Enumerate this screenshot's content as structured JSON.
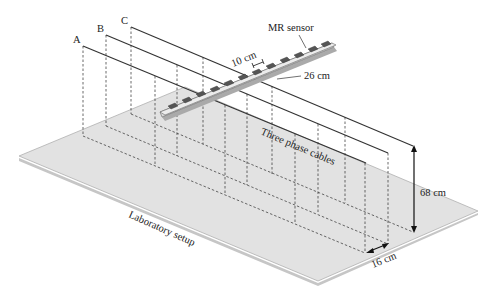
{
  "figure": {
    "title": "Laboratory setup",
    "labels": {
      "mr_sensor": "MR sensor",
      "sensor_spacing": "10 cm",
      "sensor_height_offset": "26 cm",
      "cables": "Three phase cables",
      "cable_height": "68 cm",
      "cable_spacing": "16 cm",
      "setup": "Laboratory setup"
    },
    "phases": [
      {
        "name": "A"
      },
      {
        "name": "B"
      },
      {
        "name": "C"
      }
    ],
    "sensor_count": 12,
    "colors": {
      "plate": "#e2e2e2",
      "plate_edge": "#b8b8b8",
      "sensor_bar": "#d8d8d8",
      "sensor_chip": "#555555",
      "line": "#333333"
    }
  }
}
